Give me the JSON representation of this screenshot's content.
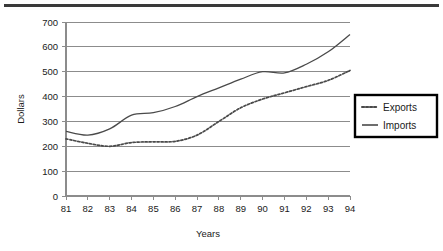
{
  "chart_data": {
    "type": "line",
    "title": "",
    "xlabel": "Years",
    "ylabel": "Dollars",
    "x": [
      "81",
      "82",
      "83",
      "84",
      "85",
      "86",
      "87",
      "88",
      "89",
      "90",
      "91",
      "92",
      "93",
      "94"
    ],
    "categories": [
      "81",
      "82",
      "83",
      "84",
      "85",
      "86",
      "87",
      "88",
      "89",
      "90",
      "91",
      "92",
      "93",
      "94"
    ],
    "ylim": [
      0,
      700
    ],
    "yticks": [
      0,
      100,
      200,
      300,
      400,
      500,
      600,
      700
    ],
    "ytick_labels": [
      "0",
      "100",
      "200",
      "300",
      "400",
      "500",
      "600",
      "700"
    ],
    "grid": "horizontal",
    "legend_position": "right",
    "series": [
      {
        "name": "Exports",
        "style": "dotted",
        "color": "#4a4a4a",
        "values": [
          230,
          212,
          200,
          215,
          218,
          220,
          245,
          300,
          355,
          390,
          415,
          440,
          465,
          505
        ]
      },
      {
        "name": "Imports",
        "style": "solid",
        "color": "#4a4a4a",
        "values": [
          260,
          245,
          270,
          325,
          335,
          360,
          400,
          435,
          470,
          500,
          495,
          530,
          580,
          650
        ]
      }
    ]
  },
  "legend": {
    "entries": [
      {
        "label": "Exports"
      },
      {
        "label": "Imports"
      }
    ]
  },
  "axes": {
    "y_title": "Dollars",
    "x_title": "Years"
  }
}
